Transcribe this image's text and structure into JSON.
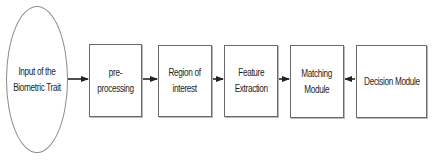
{
  "diagram": {
    "type": "flowchart",
    "direction": "left-to-right",
    "nodes": [
      {
        "id": "input",
        "shape": "ellipse",
        "label": "Input of the\nBiometric Trait"
      },
      {
        "id": "preprocessing",
        "shape": "rectangle",
        "label": "pre-processing"
      },
      {
        "id": "roi",
        "shape": "rectangle",
        "label": "Region of\ninterest"
      },
      {
        "id": "feature",
        "shape": "rectangle",
        "label": "Feature\nExtraction"
      },
      {
        "id": "matching",
        "shape": "rectangle",
        "label": "Matching\nModule"
      },
      {
        "id": "decision",
        "shape": "rectangle",
        "label": "Decision Module"
      }
    ],
    "edges": [
      {
        "from": "input",
        "to": "preprocessing"
      },
      {
        "from": "preprocessing",
        "to": "roi"
      },
      {
        "from": "roi",
        "to": "feature"
      },
      {
        "from": "feature",
        "to": "matching"
      },
      {
        "from": "decision",
        "to": "matching"
      }
    ],
    "colors": {
      "stroke": "#6a6a6a",
      "arrow": "#222222",
      "text": "#1e1e1e",
      "background": "#ffffff"
    }
  }
}
